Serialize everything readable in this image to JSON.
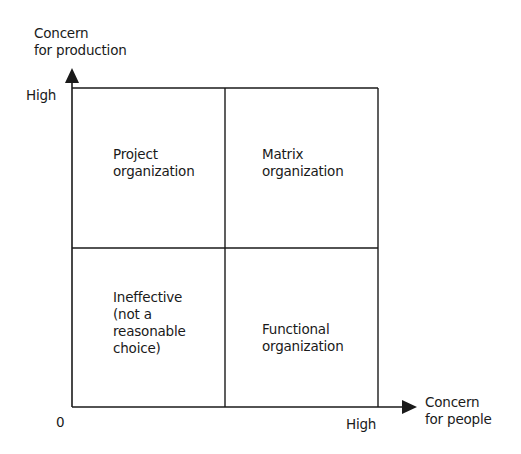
{
  "diagram": {
    "type": "2x2 matrix",
    "y_axis": {
      "label_line1": "Concern",
      "label_line2": "for production",
      "high_label": "High"
    },
    "x_axis": {
      "label_line1": "Concern",
      "label_line2": "for people",
      "high_label": "High"
    },
    "origin_label": "0",
    "quadrants": {
      "top_left": [
        "Project",
        "organization"
      ],
      "top_right": [
        "Matrix",
        "organization"
      ],
      "bottom_left": [
        "Ineffective",
        "(not a",
        "reasonable",
        "choice)"
      ],
      "bottom_right": [
        "Functional",
        "organization"
      ]
    },
    "colors": {
      "line": "#1a1a1a",
      "background": "#ffffff"
    }
  }
}
